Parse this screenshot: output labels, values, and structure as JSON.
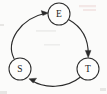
{
  "figure": {
    "kind": "directed-cycle-graph",
    "width": 107,
    "height": 94,
    "background_color": "#fbfbfa",
    "stroke_color": "#2b2b2b",
    "label_color": "#1d1d1d",
    "node_fill_color": "#fdfdfc"
  },
  "nodes": [
    {
      "id": "E",
      "label": "E",
      "cx": 59,
      "cy": 14,
      "r": 11
    },
    {
      "id": "S",
      "label": "S",
      "cx": 20,
      "cy": 69,
      "r": 11
    },
    {
      "id": "T",
      "label": "T",
      "cx": 88,
      "cy": 69,
      "r": 11
    }
  ],
  "edges": [
    {
      "id": "s-to-e",
      "from": "S",
      "to": "E",
      "label": "",
      "curve": "left-bulge",
      "arrow_at": "E"
    },
    {
      "id": "e-to-t",
      "from": "E",
      "to": "T",
      "label": "",
      "curve": "right-bulge",
      "arrow_at": "T"
    },
    {
      "id": "t-to-s",
      "from": "T",
      "to": "S",
      "label": "",
      "curve": "bottom-bulge",
      "arrow_at": "S"
    }
  ]
}
